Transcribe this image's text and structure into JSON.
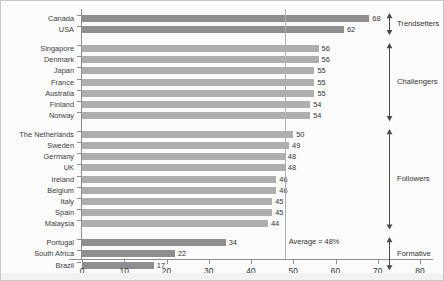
{
  "chart_data": {
    "type": "bar",
    "orientation": "horizontal",
    "title": "",
    "xlabel": "",
    "ylabel": "",
    "xlim": [
      0,
      80
    ],
    "xticks": [
      0,
      10,
      20,
      30,
      40,
      50,
      60,
      70,
      80
    ],
    "grid": false,
    "legend": null,
    "categories": [
      "Canada",
      "USA",
      "Singapore",
      "Denmark",
      "Japan",
      "France",
      "Australia",
      "Finland",
      "Norway",
      "The Netherlands",
      "Sweden",
      "Germany",
      "UK",
      "Ireland",
      "Belgium",
      "Italy",
      "Spain",
      "Malaysia",
      "Portugal",
      "South Africa",
      "Brazil"
    ],
    "values": [
      68,
      62,
      56,
      56,
      55,
      55,
      55,
      54,
      54,
      50,
      49,
      48,
      48,
      46,
      46,
      45,
      45,
      44,
      34,
      22,
      17
    ],
    "annotations": {
      "average_line_value": 48,
      "average_label": "Average = 48%"
    },
    "groups": [
      {
        "label": "Trendsetters",
        "members": [
          "Canada",
          "USA"
        ],
        "color": "#8e8e8e"
      },
      {
        "label": "Challengers",
        "members": [
          "Singapore",
          "Denmark",
          "Japan",
          "France",
          "Australia",
          "Finland",
          "Norway"
        ],
        "color": "#aeaeae"
      },
      {
        "label": "Followers",
        "members": [
          "The Netherlands",
          "Sweden",
          "Germany",
          "UK",
          "Ireland",
          "Belgium",
          "Italy",
          "Spain",
          "Malaysia"
        ],
        "color": "#aeaeae"
      },
      {
        "label": "Formative",
        "members": [
          "Portugal",
          "South Africa",
          "Brazil"
        ],
        "color": "#8e8e8e"
      }
    ],
    "colors": {
      "bar_dark": "#8e8e8e",
      "bar_light": "#aeaeae",
      "axis": "#8d8d8d",
      "average_line": "#b0b0b0",
      "text": "#333333",
      "background": "#fbfbfb"
    }
  },
  "caption": {
    "text": ""
  }
}
